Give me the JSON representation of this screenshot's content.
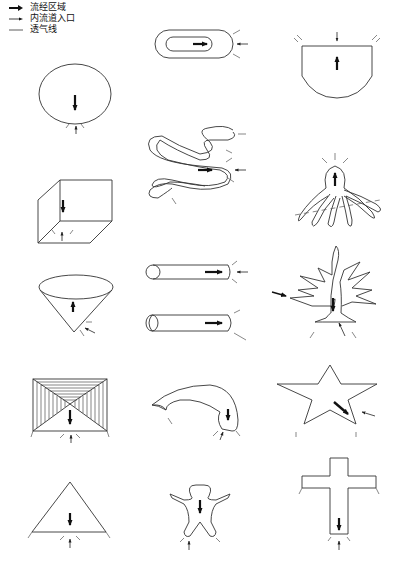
{
  "legend": {
    "items": [
      {
        "symbol": "thick-arrow",
        "label": "流经区域"
      },
      {
        "symbol": "thin-arrow",
        "label": "内流道入口"
      },
      {
        "symbol": "line",
        "label": "透气线"
      }
    ]
  },
  "shapes": [
    {
      "row": 1,
      "col": 2,
      "name": "oval-ring"
    },
    {
      "row": 1,
      "col": 3,
      "name": "bowl"
    },
    {
      "row": 2,
      "col": 1,
      "name": "ellipse"
    },
    {
      "row": 2,
      "col": 2,
      "name": "snake"
    },
    {
      "row": 2,
      "col": 3,
      "name": "octopus"
    },
    {
      "row": 3,
      "col": 1,
      "name": "box"
    },
    {
      "row": 3,
      "col": 3,
      "name": "tree"
    },
    {
      "row": 4,
      "col": 1,
      "name": "cone"
    },
    {
      "row": 4,
      "col": 2,
      "name": "tubes"
    },
    {
      "row": 5,
      "col": 1,
      "name": "pyramid-frame"
    },
    {
      "row": 5,
      "col": 2,
      "name": "horn"
    },
    {
      "row": 5,
      "col": 3,
      "name": "star"
    },
    {
      "row": 6,
      "col": 1,
      "name": "triangle"
    },
    {
      "row": 6,
      "col": 2,
      "name": "human-figure"
    },
    {
      "row": 6,
      "col": 3,
      "name": "cross"
    }
  ]
}
